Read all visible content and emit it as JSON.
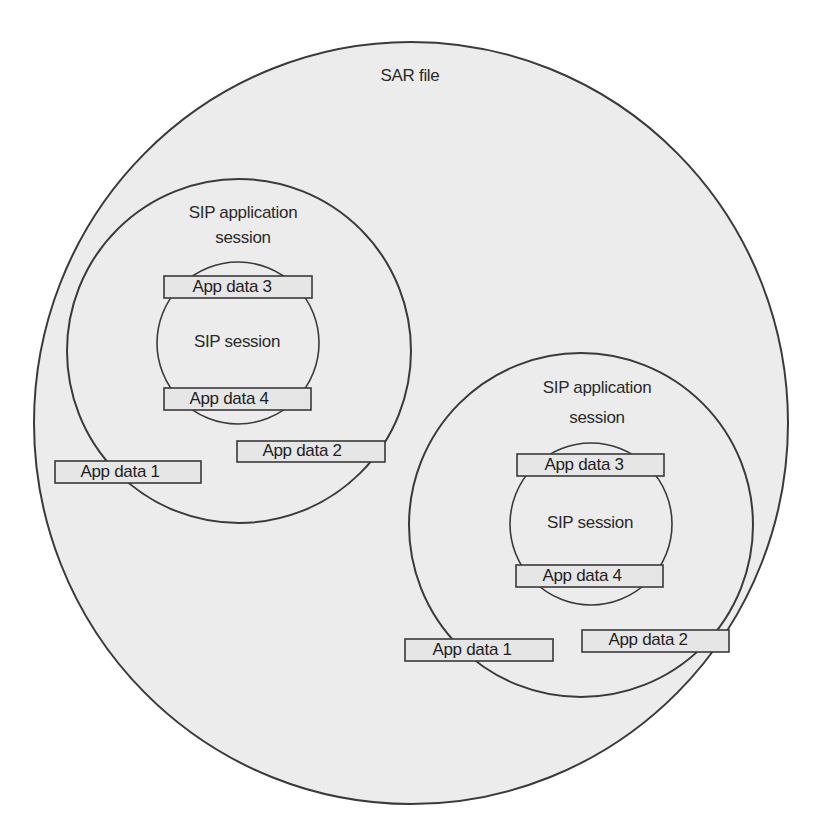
{
  "diagram": {
    "title": "SAR file",
    "colors": {
      "background": "#ffffff",
      "fill": "#ececec",
      "box_fill": "#e6e6e6",
      "stroke": "#3a3a3a",
      "text": "#2a2a2a"
    },
    "sar_file": {
      "label": "SAR file"
    },
    "app_sessions": [
      {
        "label_line1": "SIP application",
        "label_line2": "session",
        "sip_session": {
          "label": "SIP session",
          "app_data_top": "App data 3",
          "app_data_bottom": "App data 4"
        },
        "app_data_a": "App data 1",
        "app_data_b": "App data 2"
      },
      {
        "label_line1": "SIP application",
        "label_line2": "session",
        "sip_session": {
          "label": "SIP session",
          "app_data_top": "App data 3",
          "app_data_bottom": "App data 4"
        },
        "app_data_a": "App data 1",
        "app_data_b": "App data 2"
      }
    ]
  }
}
